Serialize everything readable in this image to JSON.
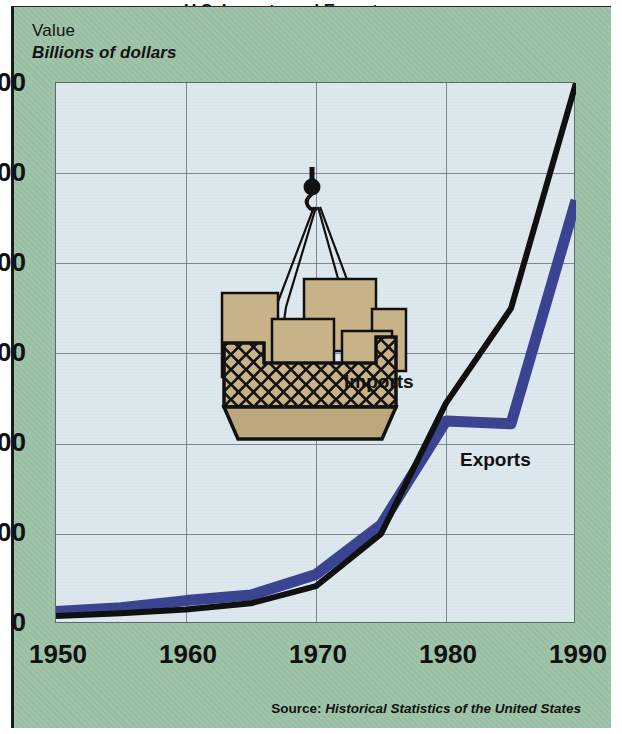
{
  "panel": {
    "background_color": "#9cc2a6",
    "plot_background_color": "#dce8ee",
    "title_partial": "U.S. Imports and Exports"
  },
  "axis_captions": {
    "value_label": "Value",
    "units_label": "Billions of dollars"
  },
  "series_labels": {
    "imports": "Imports",
    "exports": "Exports"
  },
  "source": {
    "lead": "Source:",
    "title": "Historical Statistics of the United States"
  },
  "illustration": {
    "name": "cargo-net-crane",
    "box_color": "#c8b287",
    "line_color": "#111111"
  },
  "chart_data": {
    "type": "line",
    "title": "U.S. Imports and Exports",
    "xlabel": "",
    "ylabel": "Billions of dollars",
    "xlim": [
      1950,
      1990
    ],
    "ylim": [
      0,
      600
    ],
    "xticks": [
      1950,
      1960,
      1970,
      1980,
      1990
    ],
    "yticks": [
      0,
      100,
      200,
      300,
      400,
      500,
      600
    ],
    "grid": true,
    "legend": "inline-annotations",
    "series": [
      {
        "name": "Imports",
        "color": "#101010",
        "x": [
          1950,
          1955,
          1960,
          1965,
          1970,
          1975,
          1980,
          1985,
          1990
        ],
        "values": [
          9,
          12,
          16,
          23,
          42,
          100,
          245,
          350,
          600
        ]
      },
      {
        "name": "Exports",
        "color": "#3a4490",
        "x": [
          1950,
          1955,
          1960,
          1965,
          1970,
          1975,
          1980,
          1985,
          1990
        ],
        "values": [
          14,
          18,
          26,
          32,
          55,
          110,
          225,
          222,
          470
        ]
      }
    ]
  }
}
